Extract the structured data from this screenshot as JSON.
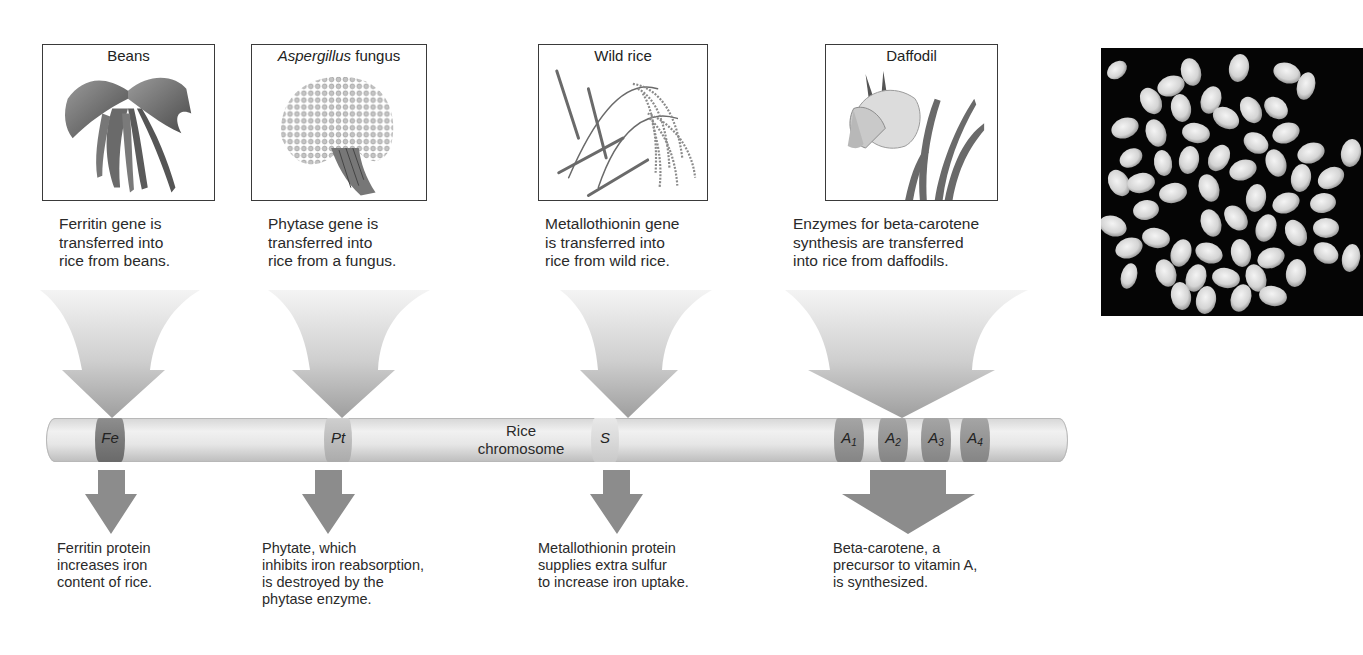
{
  "sources": [
    {
      "id": "beans",
      "title_italic": "",
      "title": "Beans",
      "description": "Ferritin gene is\ntransferred into\nrice from beans."
    },
    {
      "id": "aspergillus",
      "title_italic": "Aspergillus",
      "title": " fungus",
      "description": "Phytase gene is\ntransferred into\nrice from a fungus."
    },
    {
      "id": "wild-rice",
      "title_italic": "",
      "title": "Wild rice",
      "description": "Metallothionin gene\nis transferred into\nrice from wild rice."
    },
    {
      "id": "daffodil",
      "title_italic": "",
      "title": "Daffodil",
      "description": "Enzymes for beta-carotene\nsynthesis are transferred\ninto rice from daffodils."
    }
  ],
  "chromosome": {
    "label": "Rice\nchromosome",
    "genes": [
      {
        "symbol": "Fe",
        "sub": ""
      },
      {
        "symbol": "Pt",
        "sub": ""
      },
      {
        "symbol": "S",
        "sub": ""
      },
      {
        "symbol": "A",
        "sub": "1"
      },
      {
        "symbol": "A",
        "sub": "2"
      },
      {
        "symbol": "A",
        "sub": "3"
      },
      {
        "symbol": "A",
        "sub": "4"
      }
    ]
  },
  "outcomes": [
    "Ferritin protein\nincreases iron\ncontent of rice.",
    "Phytate, which\ninhibits iron reabsorption,\nis destroyed by the\nphytase enzyme.",
    "Metallothionin protein\nsupplies extra sulfur\nto increase iron uptake.",
    "Beta-carotene, a\nprecursor to vitamin A,\nis synthesized."
  ],
  "photo": {
    "subject": "rice grains on black background"
  },
  "colors": {
    "arrow_light": "#f2f2f2",
    "arrow_dark": "#a9a9a9",
    "band_dark": "#8f8f8f",
    "band_mid": "#a8a8a8",
    "band_light": "#d2d2d2",
    "output_arrow": "#8c8c8c"
  }
}
